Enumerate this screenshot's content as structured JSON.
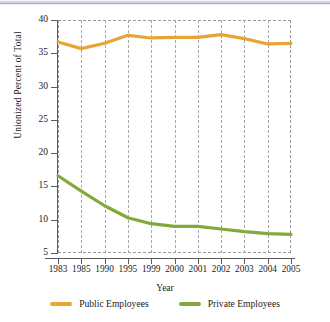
{
  "chart_data": {
    "type": "line",
    "title": "",
    "xlabel": "Year",
    "ylabel": "Unionized Percent of Total",
    "categories": [
      "1983",
      "1985",
      "1990",
      "1995",
      "1999",
      "2000",
      "2001",
      "2002",
      "2003",
      "2004",
      "2005"
    ],
    "x": [
      1983,
      1985,
      1990,
      1995,
      1999,
      2000,
      2001,
      2002,
      2003,
      2004,
      2005
    ],
    "ylim": [
      5,
      40
    ],
    "yticks": [
      5,
      10,
      15,
      20,
      25,
      30,
      35,
      40
    ],
    "ytick_labels": [
      "5",
      "10",
      "15",
      "20",
      "25",
      "30",
      "35",
      "40"
    ],
    "grid": "vertical-dashed",
    "legend_position": "bottom-center",
    "series": [
      {
        "name": "Public Employees",
        "color": "#e8a534",
        "values": [
          36.7,
          35.7,
          36.5,
          37.7,
          37.3,
          37.4,
          37.4,
          37.8,
          37.2,
          36.4,
          36.5
        ]
      },
      {
        "name": "Private Employees",
        "color": "#82a93c",
        "values": [
          16.6,
          14.3,
          12.1,
          10.3,
          9.4,
          9.0,
          9.0,
          8.6,
          8.2,
          7.9,
          7.8
        ]
      }
    ]
  },
  "legend": {
    "items": [
      {
        "label": "Public Employees",
        "color": "#e8a534"
      },
      {
        "label": "Private Employees",
        "color": "#82a93c"
      }
    ]
  },
  "axes": {
    "y_title": "Unionized Percent of Total",
    "x_title": "Year"
  }
}
